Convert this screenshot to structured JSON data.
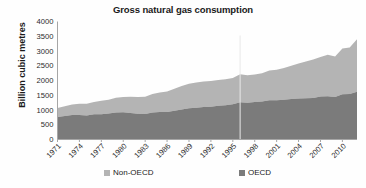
{
  "chart_data": {
    "type": "area",
    "stacked": true,
    "title": "Gross natural gas consumption",
    "xlabel": "",
    "ylabel": "Billion cubic metres",
    "ylim": [
      0,
      4000
    ],
    "ytick_step": 500,
    "yticks": [
      "0",
      "500",
      "1000",
      "1500",
      "2000",
      "2500",
      "3000",
      "3500",
      "4000"
    ],
    "grid": false,
    "legend_position": "bottom",
    "x": [
      1971,
      1972,
      1973,
      1974,
      1975,
      1976,
      1977,
      1978,
      1979,
      1980,
      1981,
      1982,
      1983,
      1984,
      1985,
      1986,
      1987,
      1988,
      1989,
      1990,
      1991,
      1992,
      1993,
      1994,
      1995,
      1996,
      1997,
      1998,
      1999,
      2000,
      2001,
      2002,
      2003,
      2004,
      2005,
      2006,
      2007,
      2008,
      2009,
      2010,
      2011,
      2012
    ],
    "xtick_labels": [
      "1971",
      "1974",
      "1977",
      "1980",
      "1983",
      "1986",
      "1989",
      "1992",
      "1995",
      "1998",
      "2001",
      "2004",
      "2007",
      "2010"
    ],
    "xtick_values": [
      1971,
      1974,
      1977,
      1980,
      1983,
      1986,
      1989,
      1992,
      1995,
      1998,
      2001,
      2004,
      2007,
      2010
    ],
    "series": [
      {
        "name": "OECD",
        "color": "#7b7b7b",
        "stack_order": 0,
        "values": [
          760,
          800,
          830,
          830,
          810,
          855,
          860,
          880,
          915,
          920,
          900,
          870,
          865,
          915,
          930,
          930,
          975,
          1020,
          1060,
          1075,
          1100,
          1110,
          1140,
          1160,
          1195,
          1265,
          1250,
          1270,
          1290,
          1330,
          1330,
          1350,
          1370,
          1390,
          1400,
          1410,
          1455,
          1470,
          1440,
          1530,
          1545,
          1620
        ]
      },
      {
        "name": "Non-OECD",
        "color": "#b4b4b4",
        "stack_order": 1,
        "values": [
          305,
          330,
          360,
          385,
          400,
          420,
          450,
          470,
          500,
          520,
          545,
          570,
          580,
          625,
          665,
          700,
          745,
          790,
          830,
          855,
          870,
          870,
          880,
          885,
          890,
          950,
          930,
          935,
          960,
          1010,
          1035,
          1075,
          1130,
          1190,
          1245,
          1300,
          1345,
          1400,
          1370,
          1555,
          1570,
          1780
        ]
      }
    ],
    "totals": [
      1065,
      1130,
      1190,
      1215,
      1210,
      1275,
      1310,
      1350,
      1415,
      1440,
      1445,
      1440,
      1445,
      1540,
      1595,
      1630,
      1720,
      1810,
      1890,
      1930,
      1970,
      1980,
      2020,
      2045,
      2085,
      2215,
      2180,
      2205,
      2250,
      2340,
      2365,
      2425,
      2500,
      2580,
      2645,
      2710,
      2800,
      2870,
      2810,
      3085,
      3115,
      3400
    ]
  },
  "legend": {
    "items": [
      {
        "label": "Non-OECD",
        "color": "#b4b4b4"
      },
      {
        "label": "OECD",
        "color": "#7b7b7b"
      }
    ]
  },
  "axis": {
    "line_color": "#a6a6a6"
  }
}
